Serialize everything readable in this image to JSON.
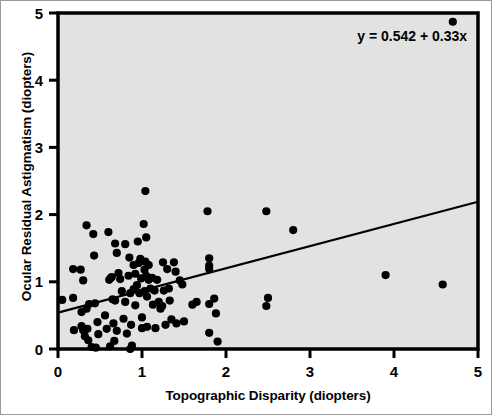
{
  "chart_data": {
    "type": "scatter",
    "title": "",
    "xlabel": "Topographic Disparity (diopters)",
    "ylabel": "Ocular Residual Astigmatism (diopters)",
    "xlim": [
      0,
      5
    ],
    "ylim": [
      0,
      5
    ],
    "xticks": [
      "0",
      "1",
      "2",
      "3",
      "4",
      "5"
    ],
    "yticks": [
      "0",
      "1",
      "2",
      "3",
      "4",
      "5"
    ],
    "xtick_values": [
      0,
      1,
      2,
      3,
      4,
      5
    ],
    "ytick_values": [
      0,
      1,
      2,
      3,
      4,
      5
    ],
    "grid": false,
    "legend": null,
    "annotation": "y = 0.542 + 0.33x",
    "marker": {
      "shape": "circle",
      "color": "#000000",
      "size_px": 5
    },
    "plot_background": "#e2e2e2",
    "fit_line": {
      "type": "linear",
      "intercept": 0.542,
      "slope": 0.33,
      "equation": "y = 0.542 + 0.33x",
      "x_start": 0,
      "x_end": 5,
      "y_start": 0.542,
      "y_end": 2.192,
      "color": "#000000"
    },
    "points": [
      [
        0.05,
        0.73
      ],
      [
        0.18,
        1.19
      ],
      [
        0.18,
        0.76
      ],
      [
        0.19,
        0.28
      ],
      [
        0.27,
        1.18
      ],
      [
        0.28,
        0.55
      ],
      [
        0.28,
        0.34
      ],
      [
        0.3,
        1.02
      ],
      [
        0.3,
        0.28
      ],
      [
        0.32,
        0.19
      ],
      [
        0.34,
        1.84
      ],
      [
        0.34,
        0.6
      ],
      [
        0.35,
        0.3
      ],
      [
        0.36,
        0.13
      ],
      [
        0.37,
        0.67
      ],
      [
        0.4,
        0.03
      ],
      [
        0.42,
        1.71
      ],
      [
        0.43,
        1.39
      ],
      [
        0.44,
        0.68
      ],
      [
        0.45,
        0.02
      ],
      [
        0.47,
        0.4
      ],
      [
        0.48,
        0.22
      ],
      [
        0.56,
        0.5
      ],
      [
        0.58,
        0.3
      ],
      [
        0.6,
        1.74
      ],
      [
        0.61,
        1.03
      ],
      [
        0.62,
        0.04
      ],
      [
        0.63,
        1.06
      ],
      [
        0.64,
        1.07
      ],
      [
        0.65,
        0.74
      ],
      [
        0.66,
        0.38
      ],
      [
        0.67,
        0.12
      ],
      [
        0.68,
        1.57
      ],
      [
        0.68,
        0.72
      ],
      [
        0.7,
        1.43
      ],
      [
        0.7,
        0.27
      ],
      [
        0.72,
        1.13
      ],
      [
        0.74,
        1.04
      ],
      [
        0.76,
        0.86
      ],
      [
        0.78,
        0.45
      ],
      [
        0.8,
        1.56
      ],
      [
        0.8,
        0.7
      ],
      [
        0.82,
        0.23
      ],
      [
        0.84,
        1.09
      ],
      [
        0.85,
        1.36
      ],
      [
        0.86,
        0.83
      ],
      [
        0.86,
        0.0
      ],
      [
        0.87,
        0.36
      ],
      [
        0.88,
        0.05
      ],
      [
        0.9,
        1.25
      ],
      [
        0.9,
        0.89
      ],
      [
        0.92,
        1.12
      ],
      [
        0.92,
        0.65
      ],
      [
        0.94,
        0.95
      ],
      [
        0.95,
        1.6
      ],
      [
        0.96,
        1.28
      ],
      [
        0.97,
        0.83
      ],
      [
        0.98,
        1.34
      ],
      [
        0.99,
        1.05
      ],
      [
        1.0,
        0.47
      ],
      [
        1.0,
        0.31
      ],
      [
        1.02,
        1.86
      ],
      [
        1.03,
        1.18
      ],
      [
        1.03,
        0.86
      ],
      [
        1.04,
        2.35
      ],
      [
        1.04,
        1.3
      ],
      [
        1.05,
        1.66
      ],
      [
        1.05,
        1.09
      ],
      [
        1.06,
        0.78
      ],
      [
        1.06,
        0.33
      ],
      [
        1.08,
        1.25
      ],
      [
        1.08,
        1.03
      ],
      [
        1.1,
        0.9
      ],
      [
        1.12,
        1.06
      ],
      [
        1.13,
        0.66
      ],
      [
        1.15,
        0.87
      ],
      [
        1.16,
        0.31
      ],
      [
        1.18,
        1.03
      ],
      [
        1.2,
        0.7
      ],
      [
        1.22,
        0.6
      ],
      [
        1.24,
        0.64
      ],
      [
        1.25,
        1.29
      ],
      [
        1.26,
        0.87
      ],
      [
        1.28,
        0.36
      ],
      [
        1.3,
        1.19
      ],
      [
        1.32,
        0.9
      ],
      [
        1.33,
        0.72
      ],
      [
        1.35,
        0.44
      ],
      [
        1.38,
        1.29
      ],
      [
        1.4,
        1.15
      ],
      [
        1.41,
        0.38
      ],
      [
        1.45,
        1.02
      ],
      [
        1.48,
        0.96
      ],
      [
        1.5,
        0.41
      ],
      [
        1.6,
        0.66
      ],
      [
        1.65,
        0.7
      ],
      [
        1.78,
        2.05
      ],
      [
        1.8,
        1.35
      ],
      [
        1.8,
        1.24
      ],
      [
        1.8,
        1.19
      ],
      [
        1.8,
        0.67
      ],
      [
        1.8,
        0.24
      ],
      [
        1.86,
        0.75
      ],
      [
        1.88,
        0.53
      ],
      [
        1.9,
        0.11
      ],
      [
        2.48,
        2.05
      ],
      [
        2.48,
        0.64
      ],
      [
        2.5,
        0.76
      ],
      [
        2.8,
        1.77
      ],
      [
        3.9,
        1.1
      ],
      [
        4.58,
        0.96
      ],
      [
        4.7,
        4.87
      ]
    ]
  },
  "axes": {
    "xlabel_text": "Topographic Disparity (diopters)",
    "ylabel_text": "Ocular Residual Astigmatism (diopters)"
  },
  "annotation": {
    "equation_text": "y = 0.542 + 0.33x"
  }
}
